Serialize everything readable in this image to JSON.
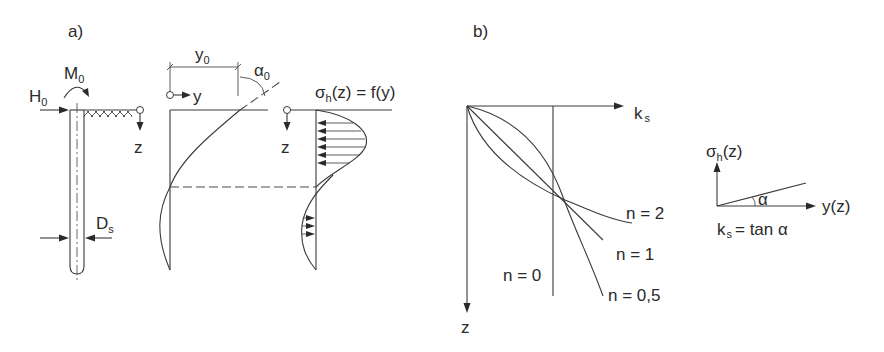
{
  "panel_a": {
    "label": "a)",
    "load_labels": {
      "horizontal_force": "H",
      "horizontal_force_sub": "0",
      "moment": "M",
      "moment_sub": "0",
      "diameter": "D",
      "diameter_sub": "s"
    },
    "deflection": {
      "axis_y": "y",
      "axis_z": "z",
      "displacement": "y",
      "displacement_sub": "0",
      "rotation": "α",
      "rotation_sub": "0"
    },
    "pressure": {
      "title_sigma": "σ",
      "title_sub": "h",
      "title_rest": "(z) = f(y)",
      "axis_z": "z"
    }
  },
  "panel_b": {
    "label": "b)",
    "axis_x": "k",
    "axis_x_sub": "s",
    "axis_z": "z",
    "curves": [
      {
        "label": "n = 2"
      },
      {
        "label": "n = 1"
      },
      {
        "label": "n = 0"
      },
      {
        "label": "n = 0,5"
      }
    ],
    "inset": {
      "y_label_sigma": "σ",
      "y_label_sub": "h",
      "y_label_rest": "(z)",
      "x_label": "y(z)",
      "angle": "α",
      "formula_k": "k",
      "formula_sub": "s",
      "formula_rest": "= tan α"
    }
  },
  "colors": {
    "line": "#3a3a3a",
    "text": "#2a2a2a",
    "background": "#ffffff"
  }
}
